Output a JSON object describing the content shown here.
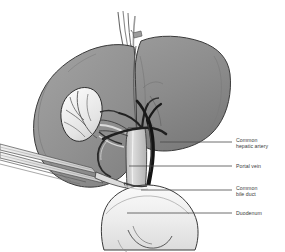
{
  "figure": {
    "background_color": "#ffffff",
    "palette": {
      "liver_right_lobe": "#8d8d8d",
      "liver_left_lobe": "#989898",
      "liver_shadow": "#6f6f6f",
      "liver_highlight": "#a6a6a6",
      "gallbladder": "#ededed",
      "duodenum": "#f0f0f0",
      "portal_vein": "#c9c9c9",
      "bile_duct": "#1c1c1c",
      "hepatic_artery": "#2a2a2a",
      "instrument": "#e8e8e8",
      "outline": "#2b2b2b",
      "leader_line": "#4a4a4a",
      "label_text": "#3b3b3b"
    },
    "structures": [
      {
        "name": "right-hepatic-lobe",
        "label": "Right lobe of liver"
      },
      {
        "name": "left-hepatic-lobe",
        "label": "Left lobe of liver"
      },
      {
        "name": "gallbladder",
        "label": "Gallbladder"
      },
      {
        "name": "hepatic-veins",
        "label": "Hepatic veins"
      },
      {
        "name": "surgical-instrument",
        "label": "Surgical instrument"
      }
    ]
  },
  "callouts": [
    {
      "id": "common-hepatic-artery",
      "text": "Common\nhepatic artery",
      "leader": {
        "x1": 160,
        "y1": 142,
        "x2": 232,
        "y2": 142
      },
      "label_x": 236,
      "label_y": 137
    },
    {
      "id": "portal-vein",
      "text": "Portal vein",
      "leader": {
        "x1": 129,
        "y1": 166,
        "x2": 232,
        "y2": 166
      },
      "label_x": 236,
      "label_y": 163
    },
    {
      "id": "common-bile-duct",
      "text": "Common\nbile duct",
      "leader": {
        "x1": 141,
        "y1": 190,
        "x2": 232,
        "y2": 190
      },
      "label_x": 236,
      "label_y": 185
    },
    {
      "id": "duodenum",
      "text": "Duodenum",
      "leader": {
        "x1": 127,
        "y1": 213,
        "x2": 232,
        "y2": 213
      },
      "label_x": 236,
      "label_y": 210
    }
  ]
}
